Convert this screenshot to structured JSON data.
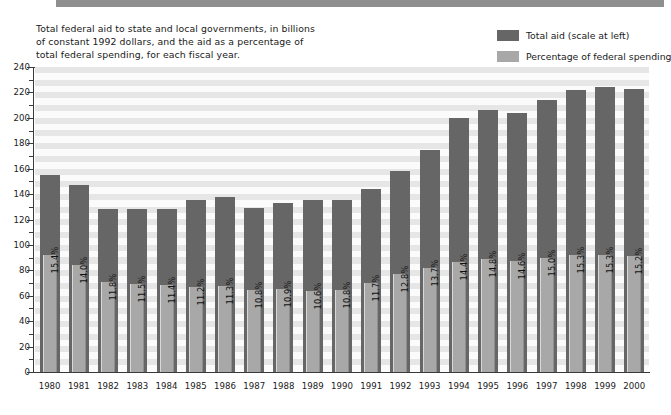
{
  "caption": {
    "line1": "Total federal aid to state and local governments, in billions",
    "line2": "of constant 1992 dollars, and the aid as a percentage of",
    "line3": "total federal spending, for each fiscal year."
  },
  "legend": {
    "items": [
      {
        "label": "Total aid (scale at left)",
        "color": "#666666"
      },
      {
        "label": "Percentage of federal spending",
        "color": "#a8a8a8"
      }
    ]
  },
  "colors": {
    "total_aid_bar": "#666666",
    "percentage_bar": "#a8a8a8",
    "axis": "#3a3a3a",
    "plot_band_dark": "#e6e6e6",
    "plot_band_light": "#fbfbfb",
    "banner": "#8f8f8f"
  },
  "chart_data": {
    "type": "bar",
    "title": "Total federal aid to state and local governments, in billions of constant 1992 dollars, and the aid as a percentage of total federal spending, for each fiscal year.",
    "xlabel": "",
    "ylabel": "",
    "ylim": [
      0,
      240
    ],
    "ytick_labels": [
      "0",
      "20",
      "40",
      "60",
      "80",
      "100",
      "120",
      "140",
      "160",
      "180",
      "200",
      "220",
      "240"
    ],
    "ytick_values": [
      0,
      20,
      40,
      60,
      80,
      100,
      120,
      140,
      160,
      180,
      200,
      220,
      240
    ],
    "minor_tick_step": 10,
    "grid": true,
    "legend_position": "top-right",
    "categories": [
      "1980",
      "1981",
      "1982",
      "1983",
      "1984",
      "1985",
      "1986",
      "1987",
      "1988",
      "1989",
      "1990",
      "1991",
      "1992",
      "1993",
      "1994",
      "1995",
      "1996",
      "1997",
      "1998",
      "1999",
      "2000"
    ],
    "series": [
      {
        "name": "Total aid (scale at left)",
        "unit": "billions of constant 1992 dollars",
        "values": [
          155,
          147,
          128,
          128,
          128,
          135,
          138,
          129,
          133,
          135,
          135,
          144,
          158,
          175,
          200,
          206,
          204,
          214,
          222,
          224,
          223
        ]
      },
      {
        "name": "Percentage of federal spending",
        "unit": "percent",
        "values": [
          15.4,
          14.0,
          11.8,
          11.5,
          11.4,
          11.2,
          11.3,
          10.8,
          10.9,
          10.6,
          10.8,
          11.7,
          12.8,
          13.7,
          14.4,
          14.8,
          14.6,
          15.0,
          15.3,
          15.3,
          15.2
        ],
        "labels": [
          "15.4%",
          "14.0%",
          "11.8%",
          "11.5%",
          "11.4%",
          "11.2%",
          "11.3%",
          "10.8%",
          "10.9%",
          "10.6%",
          "10.8%",
          "11.7%",
          "12.8%",
          "13.7%",
          "14.4%",
          "14.8%",
          "14.6%",
          "15.0%",
          "15.3%",
          "15.3%",
          "15.2%"
        ]
      }
    ]
  }
}
